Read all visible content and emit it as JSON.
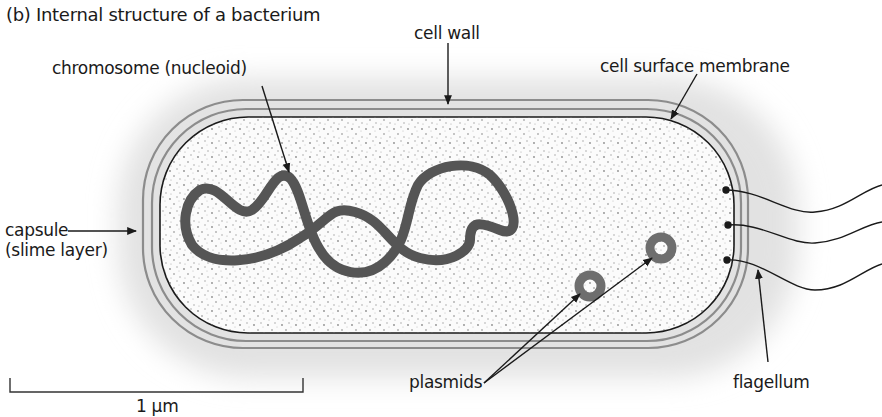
{
  "title": "(b) Internal structure of a bacterium",
  "labels": {
    "cell_wall": "cell wall",
    "chromosome": "chromosome (nucleoid)",
    "cell_surface_membrane": "cell surface membrane",
    "capsule_line1": "capsule",
    "capsule_line2": "(slime layer)",
    "plasmids": "plasmids",
    "flagellum": "flagellum"
  },
  "scale_bar": {
    "label": "1 µm"
  },
  "colors": {
    "capsule_fill": "#e6e6e6",
    "wall_lines": "#8c8c8c",
    "membrane_line": "#1a1a1a",
    "cytoplasm_fill": "#f7f7f7",
    "chromosome": "#555555",
    "plasmid": "#6e6e6e"
  }
}
